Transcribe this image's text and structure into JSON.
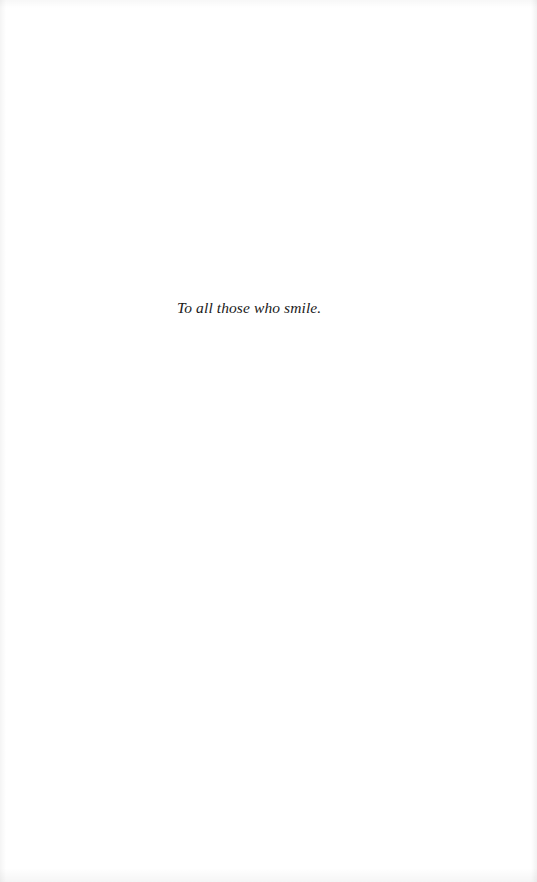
{
  "page": {
    "background_color": "#ffffff",
    "text_color": "#1a1a1a"
  },
  "dedication": {
    "text": "To all those who smile."
  }
}
